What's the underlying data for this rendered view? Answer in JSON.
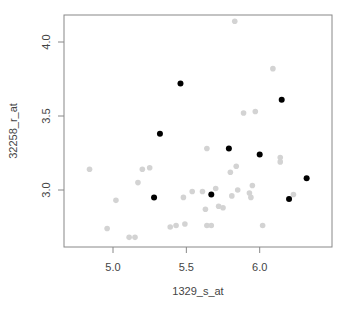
{
  "chart_data": {
    "type": "scatter",
    "title": "",
    "xlabel": "1329_s_at",
    "ylabel": "32258_r_at",
    "xlim": [
      4.66,
      6.49
    ],
    "ylim": [
      2.62,
      4.18
    ],
    "xticks": [
      5.0,
      5.5,
      6.0
    ],
    "xtick_labels": [
      "5.0",
      "5.5",
      "6.0"
    ],
    "yticks": [
      3.0,
      3.5,
      4.0
    ],
    "ytick_labels": [
      "3.0",
      "3.5",
      "4.0"
    ],
    "grid": false,
    "legend": null,
    "series": [
      {
        "name": "highlighted",
        "color": "#000000",
        "points": [
          [
            5.46,
            3.72
          ],
          [
            5.32,
            3.38
          ],
          [
            6.15,
            3.61
          ],
          [
            5.79,
            3.28
          ],
          [
            6.0,
            3.24
          ],
          [
            6.32,
            3.08
          ],
          [
            5.28,
            2.95
          ],
          [
            5.67,
            2.97
          ],
          [
            6.2,
            2.94
          ]
        ]
      },
      {
        "name": "other",
        "color": "#d3d3d3",
        "points": [
          [
            5.83,
            4.14
          ],
          [
            6.09,
            3.82
          ],
          [
            5.89,
            3.52
          ],
          [
            5.97,
            3.53
          ],
          [
            5.2,
            3.14
          ],
          [
            5.25,
            3.15
          ],
          [
            4.84,
            3.14
          ],
          [
            5.17,
            3.05
          ],
          [
            4.96,
            2.74
          ],
          [
            5.02,
            2.93
          ],
          [
            5.11,
            2.68
          ],
          [
            5.15,
            2.68
          ],
          [
            5.64,
            3.28
          ],
          [
            5.84,
            3.16
          ],
          [
            5.8,
            3.12
          ],
          [
            5.85,
            3.0
          ],
          [
            5.81,
            2.96
          ],
          [
            5.95,
            3.03
          ],
          [
            5.93,
            2.98
          ],
          [
            5.94,
            2.95
          ],
          [
            5.61,
            2.99
          ],
          [
            5.7,
            3.01
          ],
          [
            5.48,
            2.95
          ],
          [
            5.54,
            2.99
          ],
          [
            5.63,
            2.87
          ],
          [
            5.72,
            2.89
          ],
          [
            5.75,
            2.88
          ],
          [
            5.64,
            2.76
          ],
          [
            5.43,
            2.76
          ],
          [
            5.49,
            2.77
          ],
          [
            5.67,
            2.76
          ],
          [
            6.02,
            2.76
          ],
          [
            6.14,
            3.22
          ],
          [
            6.14,
            3.19
          ],
          [
            6.23,
            2.97
          ],
          [
            5.39,
            2.75
          ]
        ]
      }
    ]
  },
  "axes": {
    "x_title": "1329_s_at",
    "y_title": "32258_r_at"
  }
}
